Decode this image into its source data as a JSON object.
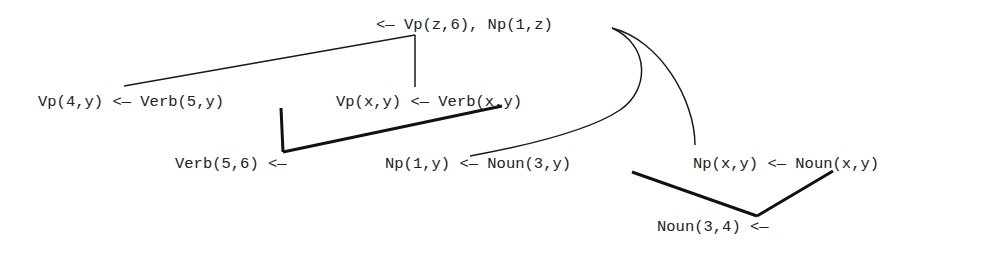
{
  "diagram": {
    "type": "proof-tree",
    "nodes": [
      {
        "id": "goal",
        "text": "<— Vp(z,6), Np(1,z)"
      },
      {
        "id": "vp1",
        "text": "Vp(4,y) <— Verb(5,y)"
      },
      {
        "id": "vp2",
        "text": "Vp(x,y) <— Verb(x,y)"
      },
      {
        "id": "verb",
        "text": "Verb(5,6) <—"
      },
      {
        "id": "np1",
        "text": "Np(1,y) <— Noun(3,y)"
      },
      {
        "id": "np2",
        "text": "Np(x,y) <— Noun(x,y)"
      },
      {
        "id": "noun",
        "text": "Noun(3,4) <—"
      }
    ],
    "edges": [
      {
        "from": "goal.Vp",
        "to": "vp1",
        "style": "thin"
      },
      {
        "from": "goal.Vp",
        "to": "vp2",
        "style": "thin"
      },
      {
        "from": "vp1.Verb",
        "to": "verb",
        "style": "thick"
      },
      {
        "from": "vp2.Verb",
        "to": "verb",
        "style": "thick"
      },
      {
        "from": "goal.Np",
        "to": "np1",
        "style": "thin-curve"
      },
      {
        "from": "goal.Np",
        "to": "np2",
        "style": "thin-curve"
      },
      {
        "from": "np1.Noun",
        "to": "noun",
        "style": "thick"
      },
      {
        "from": "np2.Noun",
        "to": "noun",
        "style": "thick"
      }
    ]
  }
}
